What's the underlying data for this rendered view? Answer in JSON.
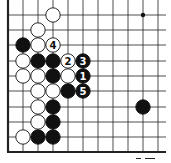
{
  "diagram": {
    "type": "go-board-fragment",
    "colors": {
      "background": "#ffffff",
      "line": "#222222",
      "black": "#111111",
      "white": "#ffffff"
    },
    "grid": {
      "x_lines": [
        8,
        23,
        38,
        53,
        68,
        83,
        98,
        113,
        128,
        143,
        158
      ],
      "y_lines": [
        15,
        30,
        45,
        61,
        76,
        91,
        107,
        122,
        137
      ],
      "left_edge_x": 8,
      "bottom_edge_y": 152,
      "right_extent": 166,
      "top_extent": 0
    },
    "hoshi": [
      {
        "col": 9,
        "row": 0
      }
    ],
    "stones": [
      {
        "color": "white",
        "col": 3,
        "row": 0,
        "label": ""
      },
      {
        "color": "white",
        "col": 2,
        "row": 1,
        "label": ""
      },
      {
        "color": "black",
        "col": 1,
        "row": 2,
        "label": ""
      },
      {
        "color": "white",
        "col": 2,
        "row": 2,
        "label": ""
      },
      {
        "color": "white",
        "col": 3,
        "row": 2,
        "label": "4"
      },
      {
        "color": "white",
        "col": 1,
        "row": 3,
        "label": ""
      },
      {
        "color": "black",
        "col": 2,
        "row": 3,
        "label": ""
      },
      {
        "color": "black",
        "col": 3,
        "row": 3,
        "label": ""
      },
      {
        "color": "white",
        "col": 4,
        "row": 3,
        "label": "2"
      },
      {
        "color": "black",
        "col": 5,
        "row": 3,
        "label": "3"
      },
      {
        "color": "white",
        "col": 1,
        "row": 4,
        "label": ""
      },
      {
        "color": "white",
        "col": 2,
        "row": 4,
        "label": ""
      },
      {
        "color": "black",
        "col": 3,
        "row": 4,
        "label": ""
      },
      {
        "color": "white",
        "col": 4,
        "row": 4,
        "label": ""
      },
      {
        "color": "black",
        "col": 5,
        "row": 4,
        "label": "1"
      },
      {
        "color": "white",
        "col": 2,
        "row": 5,
        "label": ""
      },
      {
        "color": "white",
        "col": 3,
        "row": 5,
        "label": ""
      },
      {
        "color": "black",
        "col": 4,
        "row": 5,
        "label": ""
      },
      {
        "color": "black",
        "col": 5,
        "row": 5,
        "label": "5"
      },
      {
        "color": "white",
        "col": 2,
        "row": 6,
        "label": ""
      },
      {
        "color": "black",
        "col": 3,
        "row": 6,
        "label": ""
      },
      {
        "color": "black",
        "col": 9,
        "row": 6,
        "label": ""
      },
      {
        "color": "white",
        "col": 2,
        "row": 7,
        "label": ""
      },
      {
        "color": "black",
        "col": 3,
        "row": 7,
        "label": ""
      },
      {
        "color": "white",
        "col": 1,
        "row": 8,
        "label": ""
      },
      {
        "color": "black",
        "col": 2,
        "row": 8,
        "label": ""
      },
      {
        "color": "black",
        "col": 3,
        "row": 8,
        "label": ""
      }
    ],
    "move_sequence": [
      "1",
      "2",
      "3",
      "4",
      "5"
    ]
  }
}
